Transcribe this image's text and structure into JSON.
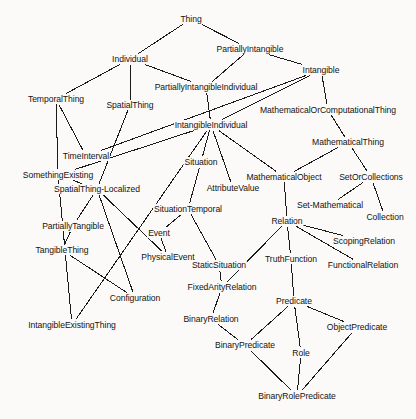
{
  "diagram": {
    "type": "node-link-graph",
    "width": 416,
    "height": 419,
    "background_color": "#fbfaf8",
    "edge_color": "#1a1a1a",
    "text_color": "#15130f",
    "nodes": [
      {
        "id": "Thing",
        "label": "Thing",
        "x": 191,
        "y": 19
      },
      {
        "id": "Individual",
        "label": "Individual",
        "x": 130,
        "y": 59
      },
      {
        "id": "PartiallyIntangible",
        "label": "PartiallyIntangible",
        "x": 250,
        "y": 49
      },
      {
        "id": "Intangible",
        "label": "Intangible",
        "x": 321,
        "y": 70
      },
      {
        "id": "PartiallyIntangibleIndividual",
        "label": "PartiallyIntangibleIndividual",
        "x": 206,
        "y": 87
      },
      {
        "id": "TemporalThing",
        "label": "TemporalThing",
        "x": 56,
        "y": 99
      },
      {
        "id": "SpatialThing",
        "label": "SpatialThing",
        "x": 130,
        "y": 105
      },
      {
        "id": "MathematicalOrComputationalThing",
        "label": "MathematicalOrComputationalThing",
        "x": 328,
        "y": 110
      },
      {
        "id": "IntangibleIndividual",
        "label": "IntangibleIndividual",
        "x": 211,
        "y": 125
      },
      {
        "id": "MathematicalThing",
        "label": "MathematicalThing",
        "x": 348,
        "y": 142
      },
      {
        "id": "TimeInterval",
        "label": "TimeInterval",
        "x": 86,
        "y": 156
      },
      {
        "id": "Situation",
        "label": "Situation",
        "x": 201,
        "y": 162
      },
      {
        "id": "SomethingExisting",
        "label": "SomethingExisting",
        "x": 58,
        "y": 175
      },
      {
        "id": "MathematicalObject",
        "label": "MathematicalObject",
        "x": 284,
        "y": 177
      },
      {
        "id": "SetOrCollections",
        "label": "SetOrCollections",
        "x": 371,
        "y": 177
      },
      {
        "id": "SpatialThing-Localized",
        "label": "SpatialThing-Localized",
        "x": 97,
        "y": 189
      },
      {
        "id": "AttributeValue",
        "label": "AttributeValue",
        "x": 233,
        "y": 188
      },
      {
        "id": "Set-Mathematical",
        "label": "Set-Mathematical",
        "x": 330,
        "y": 205
      },
      {
        "id": "SituationTemporal",
        "label": "SituationTemporal",
        "x": 188,
        "y": 209
      },
      {
        "id": "Collection",
        "label": "Collection",
        "x": 385,
        "y": 217
      },
      {
        "id": "Relation",
        "label": "Relation",
        "x": 287,
        "y": 221
      },
      {
        "id": "PartiallyTangible",
        "label": "PartiallyTangible",
        "x": 73,
        "y": 226
      },
      {
        "id": "Event",
        "label": "Event",
        "x": 159,
        "y": 233
      },
      {
        "id": "ScopingRelation",
        "label": "ScopingRelation",
        "x": 364,
        "y": 241
      },
      {
        "id": "TangibleThing",
        "label": "TangibleThing",
        "x": 62,
        "y": 250
      },
      {
        "id": "TruthFunction",
        "label": "TruthFunction",
        "x": 291,
        "y": 259
      },
      {
        "id": "PhysicalEvent",
        "label": "PhysicalEvent",
        "x": 168,
        "y": 257
      },
      {
        "id": "FunctionalRelation",
        "label": "FunctionalRelation",
        "x": 363,
        "y": 265
      },
      {
        "id": "StaticSituation",
        "label": "StaticSituation",
        "x": 219,
        "y": 265
      },
      {
        "id": "FixedArityRelation",
        "label": "FixedArityRelation",
        "x": 222,
        "y": 287
      },
      {
        "id": "Configuration",
        "label": "Configuration",
        "x": 135,
        "y": 298
      },
      {
        "id": "Predicate",
        "label": "Predicate",
        "x": 294,
        "y": 301
      },
      {
        "id": "ObjectPredicate",
        "label": "ObjectPredicate",
        "x": 357,
        "y": 327
      },
      {
        "id": "BinaryRelation",
        "label": "BinaryRelation",
        "x": 211,
        "y": 319
      },
      {
        "id": "IntangibleExistingThing",
        "label": "IntangibleExistingThing",
        "x": 72,
        "y": 325
      },
      {
        "id": "BinaryPredicate",
        "label": "BinaryPredicate",
        "x": 245,
        "y": 345
      },
      {
        "id": "Role",
        "label": "Role",
        "x": 301,
        "y": 353
      },
      {
        "id": "BinaryRolePredicate",
        "label": "BinaryRolePredicate",
        "x": 297,
        "y": 396
      }
    ],
    "edges": [
      {
        "from": "Thing",
        "to": "Individual"
      },
      {
        "from": "Thing",
        "to": "PartiallyIntangible"
      },
      {
        "from": "Individual",
        "to": "TemporalThing"
      },
      {
        "from": "Individual",
        "to": "SpatialThing"
      },
      {
        "from": "Individual",
        "to": "PartiallyIntangibleIndividual"
      },
      {
        "from": "PartiallyIntangible",
        "to": "PartiallyIntangibleIndividual"
      },
      {
        "from": "PartiallyIntangible",
        "to": "Intangible"
      },
      {
        "from": "Intangible",
        "to": "IntangibleIndividual"
      },
      {
        "from": "Intangible",
        "to": "MathematicalOrComputationalThing"
      },
      {
        "from": "Intangible",
        "to": "TimeInterval"
      },
      {
        "from": "PartiallyIntangibleIndividual",
        "to": "IntangibleIndividual"
      },
      {
        "from": "TemporalThing",
        "to": "TimeInterval"
      },
      {
        "from": "TemporalThing",
        "to": "SomethingExisting"
      },
      {
        "from": "SpatialThing",
        "to": "SpatialThing-Localized"
      },
      {
        "from": "MathematicalOrComputationalThing",
        "to": "MathematicalThing"
      },
      {
        "from": "IntangibleIndividual",
        "to": "Situation"
      },
      {
        "from": "IntangibleIndividual",
        "to": "AttributeValue"
      },
      {
        "from": "IntangibleIndividual",
        "to": "MathematicalObject"
      },
      {
        "from": "IntangibleIndividual",
        "to": "SomethingExisting"
      },
      {
        "from": "IntangibleIndividual",
        "to": "IntangibleExistingThing"
      },
      {
        "from": "MathematicalThing",
        "to": "MathematicalObject"
      },
      {
        "from": "MathematicalThing",
        "to": "SetOrCollections"
      },
      {
        "from": "SomethingExisting",
        "to": "SpatialThing-Localized"
      },
      {
        "from": "SomethingExisting",
        "to": "IntangibleExistingThing"
      },
      {
        "from": "MathematicalObject",
        "to": "Relation"
      },
      {
        "from": "SetOrCollections",
        "to": "Set-Mathematical"
      },
      {
        "from": "SetOrCollections",
        "to": "Collection"
      },
      {
        "from": "SpatialThing-Localized",
        "to": "PartiallyTangible"
      },
      {
        "from": "SpatialThing-Localized",
        "to": "PhysicalEvent"
      },
      {
        "from": "SpatialThing-Localized",
        "to": "Configuration"
      },
      {
        "from": "Situation",
        "to": "SituationTemporal"
      },
      {
        "from": "SituationTemporal",
        "to": "Event"
      },
      {
        "from": "SituationTemporal",
        "to": "StaticSituation"
      },
      {
        "from": "PartiallyTangible",
        "to": "TangibleThing"
      },
      {
        "from": "Event",
        "to": "PhysicalEvent"
      },
      {
        "from": "TangibleThing",
        "to": "Configuration"
      },
      {
        "from": "Relation",
        "to": "ScopingRelation"
      },
      {
        "from": "Relation",
        "to": "FunctionalRelation"
      },
      {
        "from": "Relation",
        "to": "TruthFunction"
      },
      {
        "from": "Relation",
        "to": "FixedArityRelation"
      },
      {
        "from": "StaticSituation",
        "to": "FixedArityRelation"
      },
      {
        "from": "TruthFunction",
        "to": "Predicate"
      },
      {
        "from": "FixedArityRelation",
        "to": "BinaryRelation"
      },
      {
        "from": "Predicate",
        "to": "BinaryPredicate"
      },
      {
        "from": "Predicate",
        "to": "Role"
      },
      {
        "from": "Predicate",
        "to": "ObjectPredicate"
      },
      {
        "from": "BinaryRelation",
        "to": "BinaryPredicate"
      },
      {
        "from": "BinaryPredicate",
        "to": "BinaryRolePredicate"
      },
      {
        "from": "Role",
        "to": "BinaryRolePredicate"
      },
      {
        "from": "ObjectPredicate",
        "to": "BinaryRolePredicate"
      }
    ]
  }
}
